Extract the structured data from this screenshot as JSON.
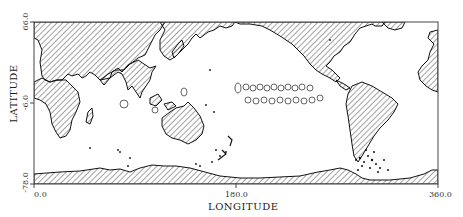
{
  "map": {
    "projection": "equirectangular",
    "x_axis": {
      "title": "LONGITUDE",
      "ticks": [
        {
          "value": 0.0,
          "label": "0.0"
        },
        {
          "value": 180.0,
          "label": "180.0"
        },
        {
          "value": 360.0,
          "label": "360.0"
        }
      ],
      "range": [
        0.0,
        360.0
      ]
    },
    "y_axis": {
      "title": "LATITUDE",
      "ticks": [
        {
          "value": 66.0,
          "label": "66.0"
        },
        {
          "value": -6.0,
          "label": "-6.0"
        },
        {
          "value": -78.0,
          "label": "-78.0"
        }
      ],
      "range": [
        -78.0,
        66.0
      ]
    },
    "land_style": "diagonal-hatch",
    "land_color": "#333333",
    "background_color": "#ffffff",
    "features": [
      "continents hatched",
      "contour outlines over equatorial Pacific",
      "scattered dots near Drake Passage / Scotia Sea",
      "scattered dots south of New Zealand"
    ]
  }
}
